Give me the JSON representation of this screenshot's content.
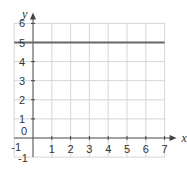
{
  "chart_data": {
    "type": "line",
    "title": "",
    "xlabel": "x",
    "ylabel": "y",
    "xlim": [
      -1,
      7
    ],
    "ylim": [
      -1,
      6
    ],
    "grid": true,
    "x_ticks": [
      "1",
      "2",
      "3",
      "4",
      "5",
      "6",
      "7"
    ],
    "y_ticks": [
      "1",
      "2",
      "3",
      "4",
      "5",
      "6"
    ],
    "origin_label": "0",
    "x_neg_label": "-1",
    "y_neg_label": "-1",
    "series": [
      {
        "name": "y = 5",
        "x": [
          -1,
          7
        ],
        "y": [
          5,
          5
        ],
        "color": "#666666"
      }
    ]
  },
  "colors": {
    "grid": "#cccccc",
    "axis": "#444444",
    "line": "#666666"
  }
}
